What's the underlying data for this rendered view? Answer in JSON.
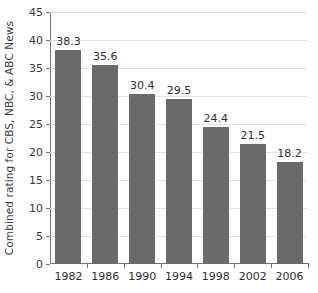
{
  "chart_data": {
    "type": "bar",
    "title": "",
    "xlabel": "",
    "ylabel": "Combined rating for CBS, NBC, & ABC News",
    "categories": [
      "1982",
      "1986",
      "1990",
      "1994",
      "1998",
      "2002",
      "2006"
    ],
    "values": [
      38.3,
      35.6,
      30.4,
      29.5,
      24.4,
      21.5,
      18.2
    ],
    "value_labels": [
      "38.3",
      "35.6",
      "30.4",
      "29.5",
      "24.4",
      "21.5",
      "18.2"
    ],
    "ylim": [
      0,
      45
    ],
    "y_ticks": [
      0,
      5,
      10,
      15,
      20,
      25,
      30,
      35,
      40,
      45
    ],
    "y_tick_labels": [
      "0",
      "5",
      "10",
      "15",
      "20",
      "25",
      "30",
      "35",
      "40",
      "45"
    ],
    "grid": true,
    "legend": false,
    "bar_color": "#6a6a6a",
    "gridline_color": "#e2e2e2",
    "axis_color": "#777777",
    "background_color": "#ffffff"
  }
}
